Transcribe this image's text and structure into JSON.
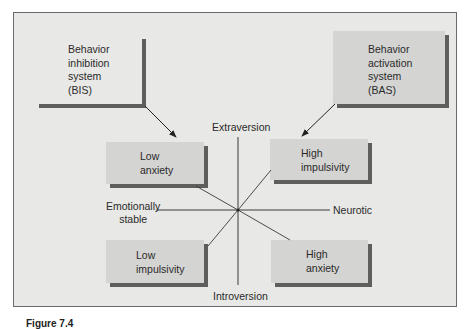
{
  "diagram": {
    "colors": {
      "panel_bg": "#e8e8e6",
      "box_fill": "#d4d4d2",
      "shadow": "#5e5e5e",
      "line": "#3a3a3a"
    },
    "systems": {
      "bis": {
        "lines": [
          "Behavior",
          "inhibition",
          "system",
          "(BIS)"
        ]
      },
      "bas": {
        "lines": [
          "Behavior",
          "activation",
          "system",
          "(BAS)"
        ]
      }
    },
    "quadrants": {
      "low_anxiety": {
        "lines": [
          "Low",
          "anxiety"
        ]
      },
      "high_impulsivity": {
        "lines": [
          "High",
          "impulsivity"
        ]
      },
      "low_impulsivity": {
        "lines": [
          "Low",
          "impulsivity"
        ]
      },
      "high_anxiety": {
        "lines": [
          "High",
          "anxiety"
        ]
      }
    },
    "axes": {
      "top": "Extraversion",
      "bottom": "Introversion",
      "left": [
        "Emotionally",
        "stable"
      ],
      "right": "Neurotic"
    },
    "caption": "Figure 7.4"
  }
}
